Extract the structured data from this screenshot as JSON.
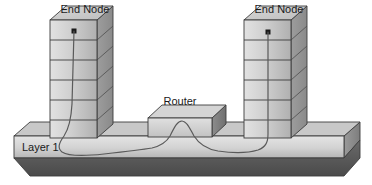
{
  "diagram": {
    "background_color": "#ffffff",
    "outline_color": "#3c3c3c",
    "cable_color": "#5a5a5a",
    "face_light_color": "#d6d6d6",
    "face_mid_color": "#b4b4b4",
    "face_dark_color": "#8f8f8f",
    "bevel_dark_color": "#595959",
    "dot_color": "#1a1a1a",
    "nodes": [
      {
        "id": "end-node-left",
        "label": "End Node",
        "label_x": 85,
        "label_y": 13,
        "layers": 6,
        "front": {
          "x": 50,
          "y": 20,
          "w": 47,
          "h": 118
        },
        "depth_x": 16,
        "depth_y": 14,
        "port_dot": {
          "x": 74,
          "y": 31,
          "size": 5
        }
      },
      {
        "id": "end-node-right",
        "label": "End Node",
        "label_x": 279,
        "label_y": 13,
        "layers": 6,
        "front": {
          "x": 244,
          "y": 20,
          "w": 47,
          "h": 118
        },
        "depth_x": 16,
        "depth_y": 14,
        "port_dot": {
          "x": 268,
          "y": 32,
          "size": 5
        }
      }
    ],
    "router": {
      "id": "router",
      "label": "Router",
      "label_x": 180,
      "label_y": 105,
      "front": {
        "x": 148,
        "y": 118,
        "w": 64,
        "h": 19
      },
      "depth_x": 14,
      "depth_y": 13
    },
    "base_slab": {
      "id": "layer-1-slab",
      "label": "Layer 1",
      "label_x": 22,
      "label_y": 151,
      "front": {
        "x": 14,
        "y": 136,
        "w": 330,
        "h": 22
      },
      "bevel_h": 18,
      "bevel_x_offset": 16
    },
    "cable": {
      "id": "physical-cable",
      "description": "Cable from left end node down through Layer 1, over the Router, and up into the right end node",
      "path": "M 74,31 L 72,104 C 71,122 68,130 64,136 C 59,143 57,148 62,152 C 68,156 86,156 104,154 C 122,152 140,150 152,148 C 160,146 166,143 170,136 C 174,128 177,121 182,121 C 187,121 190,129 194,136 C 199,144 206,149 218,151 C 232,153 248,153 258,150 C 266,147 268,142 268,134 L 268,32"
    }
  }
}
